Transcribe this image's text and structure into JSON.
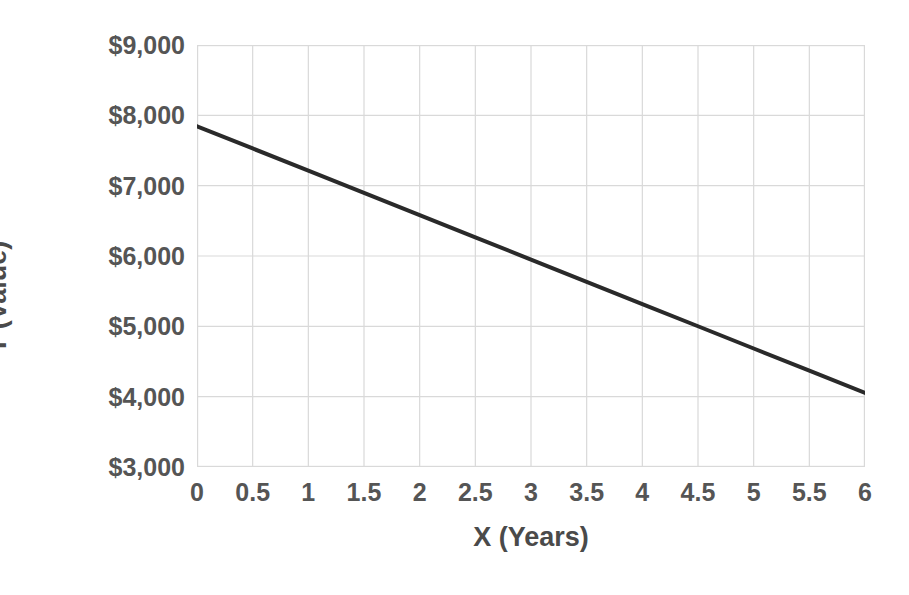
{
  "chart_data": {
    "type": "line",
    "title": "",
    "xlabel": "X (Years)",
    "ylabel": "Y (Value)",
    "x": [
      0,
      0.5,
      1,
      1.5,
      2,
      2.5,
      3,
      3.5,
      4,
      4.5,
      5,
      5.5,
      6
    ],
    "values": [
      7845,
      7529,
      7213,
      6897,
      6581,
      6265,
      5949,
      5633,
      5317,
      5001,
      4685,
      4369,
      4053
    ],
    "series": [
      {
        "name": "Value",
        "color": "#2a2a2a",
        "values": [
          7845,
          7529,
          7213,
          6897,
          6581,
          6265,
          5949,
          5633,
          5317,
          5001,
          4685,
          4369,
          4053
        ]
      }
    ],
    "xlim": [
      0,
      6
    ],
    "ylim": [
      3000,
      9000
    ],
    "xticks": [
      0,
      0.5,
      1,
      1.5,
      2,
      2.5,
      3,
      3.5,
      4,
      4.5,
      5,
      5.5,
      6
    ],
    "yticks": [
      3000,
      4000,
      5000,
      6000,
      7000,
      8000,
      9000
    ],
    "xtick_labels": [
      "0",
      "0.5",
      "1",
      "1.5",
      "2",
      "2.5",
      "3",
      "3.5",
      "4",
      "4.5",
      "5",
      "5.5",
      "6"
    ],
    "ytick_labels": [
      "$3,000",
      "$4,000",
      "$5,000",
      "$6,000",
      "$7,000",
      "$8,000",
      "$9,000"
    ],
    "grid": true,
    "grid_color": "#d9d9d9",
    "legend": false,
    "legend_position": "none",
    "background": "#ffffff",
    "line_width": 4,
    "annotations": []
  }
}
